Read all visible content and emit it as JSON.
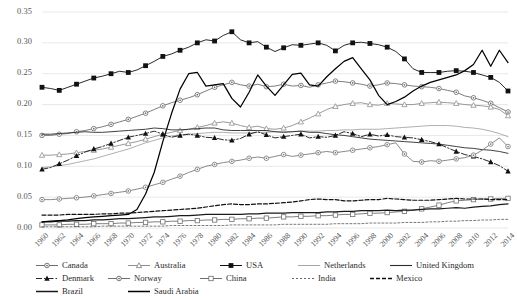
{
  "chart_data": {
    "type": "line",
    "title": "",
    "xlabel": "",
    "ylabel": "",
    "ylim": [
      0.0,
      0.35
    ],
    "ytick_labels": [
      "0.00",
      "0.05",
      "0.10",
      "0.15",
      "0.20",
      "0.25",
      "0.30",
      "0.35"
    ],
    "ytick_values": [
      0.0,
      0.05,
      0.1,
      0.15,
      0.2,
      0.25,
      0.3,
      0.35
    ],
    "grid": "horizontal",
    "legend_position": "bottom",
    "x": [
      1960,
      1961,
      1962,
      1963,
      1964,
      1965,
      1966,
      1967,
      1968,
      1969,
      1970,
      1971,
      1972,
      1973,
      1974,
      1975,
      1976,
      1977,
      1978,
      1979,
      1980,
      1981,
      1982,
      1983,
      1984,
      1985,
      1986,
      1987,
      1988,
      1989,
      1990,
      1991,
      1992,
      1993,
      1994,
      1995,
      1996,
      1997,
      1998,
      1999,
      2000,
      2001,
      2002,
      2003,
      2004,
      2005,
      2006,
      2007,
      2008,
      2009,
      2010,
      2011,
      2012,
      2013,
      2014
    ],
    "xtick_labels": [
      "1960",
      "1962",
      "1964",
      "1966",
      "1968",
      "1970",
      "1972",
      "1974",
      "1976",
      "1978",
      "1980",
      "1982",
      "1984",
      "1986",
      "1988",
      "1990",
      "1992",
      "1994",
      "1996",
      "1998",
      "2000",
      "2002",
      "2004",
      "2006",
      "2008",
      "2010",
      "2012",
      "2014"
    ],
    "series": [
      {
        "name": "Canada",
        "marker": "circle-dot",
        "color": "#6e6e6e",
        "line": "solid",
        "values": [
          0.15,
          0.15,
          0.152,
          0.153,
          0.156,
          0.158,
          0.161,
          0.164,
          0.168,
          0.172,
          0.176,
          0.181,
          0.186,
          0.192,
          0.198,
          0.203,
          0.207,
          0.211,
          0.216,
          0.222,
          0.228,
          0.232,
          0.236,
          0.232,
          0.23,
          0.233,
          0.229,
          0.23,
          0.233,
          0.23,
          0.231,
          0.228,
          0.232,
          0.235,
          0.238,
          0.237,
          0.235,
          0.233,
          0.23,
          0.232,
          0.235,
          0.234,
          0.232,
          0.23,
          0.229,
          0.228,
          0.226,
          0.223,
          0.22,
          0.214,
          0.211,
          0.207,
          0.202,
          0.195,
          0.188
        ]
      },
      {
        "name": "Australia",
        "marker": "triangle-open",
        "color": "#8f8f8f",
        "line": "solid",
        "values": [
          0.118,
          0.118,
          0.119,
          0.12,
          0.122,
          0.124,
          0.126,
          0.128,
          0.131,
          0.134,
          0.137,
          0.14,
          0.144,
          0.148,
          0.152,
          0.155,
          0.158,
          0.16,
          0.163,
          0.166,
          0.17,
          0.172,
          0.17,
          0.166,
          0.163,
          0.165,
          0.161,
          0.16,
          0.162,
          0.166,
          0.172,
          0.178,
          0.185,
          0.192,
          0.197,
          0.2,
          0.202,
          0.203,
          0.2,
          0.199,
          0.202,
          0.201,
          0.2,
          0.2,
          0.202,
          0.203,
          0.204,
          0.203,
          0.202,
          0.2,
          0.199,
          0.198,
          0.196,
          0.192,
          0.182
        ]
      },
      {
        "name": "USA",
        "marker": "square-filled",
        "color": "#111111",
        "line": "solid",
        "values": [
          0.228,
          0.226,
          0.223,
          0.228,
          0.233,
          0.238,
          0.243,
          0.246,
          0.25,
          0.254,
          0.252,
          0.256,
          0.263,
          0.27,
          0.278,
          0.282,
          0.288,
          0.293,
          0.3,
          0.305,
          0.303,
          0.312,
          0.318,
          0.305,
          0.3,
          0.302,
          0.293,
          0.286,
          0.292,
          0.297,
          0.296,
          0.298,
          0.3,
          0.296,
          0.287,
          0.296,
          0.3,
          0.301,
          0.299,
          0.297,
          0.293,
          0.286,
          0.274,
          0.258,
          0.252,
          0.252,
          0.252,
          0.254,
          0.255,
          0.254,
          0.252,
          0.248,
          0.244,
          0.236,
          0.222
        ]
      },
      {
        "name": "Netherlands",
        "marker": "none",
        "color": "#9a9a9a",
        "line": "solid-thin",
        "values": [
          0.098,
          0.099,
          0.101,
          0.103,
          0.106,
          0.109,
          0.112,
          0.116,
          0.12,
          0.124,
          0.128,
          0.133,
          0.138,
          0.142,
          0.146,
          0.149,
          0.151,
          0.152,
          0.153,
          0.154,
          0.155,
          0.155,
          0.154,
          0.154,
          0.154,
          0.155,
          0.155,
          0.156,
          0.156,
          0.156,
          0.157,
          0.157,
          0.157,
          0.158,
          0.158,
          0.159,
          0.159,
          0.16,
          0.16,
          0.16,
          0.161,
          0.162,
          0.163,
          0.164,
          0.165,
          0.166,
          0.166,
          0.166,
          0.165,
          0.163,
          0.162,
          0.16,
          0.157,
          0.153,
          0.148
        ]
      },
      {
        "name": "United Kingdom",
        "marker": "none",
        "color": "#2b2b2b",
        "line": "solid",
        "values": [
          0.152,
          0.152,
          0.153,
          0.154,
          0.155,
          0.156,
          0.155,
          0.155,
          0.156,
          0.157,
          0.158,
          0.159,
          0.16,
          0.162,
          0.161,
          0.159,
          0.159,
          0.16,
          0.161,
          0.162,
          0.162,
          0.159,
          0.158,
          0.158,
          0.158,
          0.158,
          0.158,
          0.156,
          0.155,
          0.156,
          0.157,
          0.155,
          0.155,
          0.153,
          0.151,
          0.15,
          0.148,
          0.146,
          0.144,
          0.143,
          0.142,
          0.141,
          0.14,
          0.139,
          0.138,
          0.137,
          0.136,
          0.134,
          0.132,
          0.13,
          0.129,
          0.127,
          0.126,
          0.124,
          0.121
        ]
      },
      {
        "name": "Denmark",
        "marker": "triangle-filled",
        "color": "#111111",
        "line": "dashdot",
        "values": [
          0.095,
          0.098,
          0.104,
          0.11,
          0.117,
          0.123,
          0.128,
          0.132,
          0.137,
          0.142,
          0.147,
          0.15,
          0.153,
          0.157,
          0.152,
          0.147,
          0.15,
          0.152,
          0.15,
          0.147,
          0.146,
          0.143,
          0.142,
          0.145,
          0.152,
          0.156,
          0.151,
          0.146,
          0.148,
          0.15,
          0.152,
          0.146,
          0.148,
          0.147,
          0.15,
          0.156,
          0.153,
          0.148,
          0.152,
          0.149,
          0.151,
          0.148,
          0.147,
          0.146,
          0.143,
          0.14,
          0.136,
          0.13,
          0.124,
          0.119,
          0.116,
          0.112,
          0.107,
          0.101,
          0.092
        ]
      },
      {
        "name": "Norway",
        "marker": "circle-dot",
        "color": "#7c7c7c",
        "line": "solid",
        "values": [
          0.046,
          0.046,
          0.047,
          0.048,
          0.049,
          0.05,
          0.052,
          0.054,
          0.056,
          0.058,
          0.06,
          0.063,
          0.066,
          0.07,
          0.074,
          0.079,
          0.084,
          0.09,
          0.095,
          0.1,
          0.103,
          0.106,
          0.108,
          0.11,
          0.113,
          0.115,
          0.113,
          0.116,
          0.119,
          0.116,
          0.118,
          0.12,
          0.122,
          0.124,
          0.122,
          0.124,
          0.126,
          0.128,
          0.13,
          0.132,
          0.135,
          0.138,
          0.12,
          0.108,
          0.107,
          0.109,
          0.108,
          0.11,
          0.112,
          0.114,
          0.118,
          0.126,
          0.136,
          0.146,
          0.132
        ]
      },
      {
        "name": "China",
        "marker": "square-open",
        "color": "#6f6f6f",
        "line": "solid",
        "values": [
          0.005,
          0.005,
          0.005,
          0.006,
          0.006,
          0.006,
          0.007,
          0.007,
          0.007,
          0.008,
          0.008,
          0.009,
          0.009,
          0.01,
          0.01,
          0.011,
          0.011,
          0.012,
          0.012,
          0.013,
          0.013,
          0.014,
          0.014,
          0.015,
          0.015,
          0.016,
          0.016,
          0.017,
          0.018,
          0.018,
          0.019,
          0.019,
          0.02,
          0.02,
          0.021,
          0.022,
          0.022,
          0.023,
          0.024,
          0.024,
          0.025,
          0.026,
          0.027,
          0.029,
          0.031,
          0.034,
          0.037,
          0.041,
          0.044,
          0.045,
          0.046,
          0.047,
          0.047,
          0.048,
          0.048
        ]
      },
      {
        "name": "India",
        "marker": "none",
        "color": "#555555",
        "line": "dashed-fine",
        "values": [
          0.002,
          0.002,
          0.002,
          0.002,
          0.002,
          0.002,
          0.002,
          0.003,
          0.003,
          0.003,
          0.003,
          0.003,
          0.003,
          0.003,
          0.003,
          0.004,
          0.004,
          0.004,
          0.004,
          0.004,
          0.004,
          0.004,
          0.005,
          0.005,
          0.005,
          0.005,
          0.005,
          0.005,
          0.006,
          0.006,
          0.006,
          0.006,
          0.006,
          0.006,
          0.007,
          0.007,
          0.007,
          0.007,
          0.008,
          0.008,
          0.008,
          0.008,
          0.009,
          0.009,
          0.009,
          0.01,
          0.01,
          0.011,
          0.011,
          0.012,
          0.012,
          0.013,
          0.013,
          0.014,
          0.014
        ]
      },
      {
        "name": "Mexico",
        "marker": "none",
        "color": "#111111",
        "line": "dashed",
        "values": [
          0.021,
          0.021,
          0.021,
          0.022,
          0.022,
          0.022,
          0.022,
          0.023,
          0.023,
          0.024,
          0.024,
          0.025,
          0.026,
          0.027,
          0.028,
          0.029,
          0.03,
          0.031,
          0.032,
          0.034,
          0.036,
          0.038,
          0.039,
          0.038,
          0.038,
          0.039,
          0.039,
          0.04,
          0.041,
          0.042,
          0.044,
          0.046,
          0.047,
          0.046,
          0.046,
          0.044,
          0.044,
          0.045,
          0.046,
          0.046,
          0.048,
          0.047,
          0.046,
          0.045,
          0.045,
          0.045,
          0.046,
          0.047,
          0.048,
          0.047,
          0.047,
          0.047,
          0.046,
          0.046,
          0.046
        ]
      },
      {
        "name": "Brazil",
        "marker": "none",
        "color": "#1a1a1a",
        "line": "solid-heavy",
        "values": [
          0.01,
          0.01,
          0.011,
          0.011,
          0.012,
          0.012,
          0.013,
          0.013,
          0.014,
          0.015,
          0.015,
          0.016,
          0.017,
          0.018,
          0.018,
          0.019,
          0.02,
          0.02,
          0.021,
          0.022,
          0.022,
          0.022,
          0.022,
          0.022,
          0.023,
          0.023,
          0.024,
          0.024,
          0.024,
          0.025,
          0.025,
          0.025,
          0.025,
          0.026,
          0.026,
          0.027,
          0.027,
          0.028,
          0.028,
          0.028,
          0.029,
          0.028,
          0.029,
          0.029,
          0.03,
          0.031,
          0.031,
          0.032,
          0.033,
          0.032,
          0.034,
          0.035,
          0.036,
          0.038,
          0.039
        ]
      },
      {
        "name": "Saudi Arabia",
        "marker": "none",
        "color": "#000000",
        "line": "solid-heavy",
        "values": [
          0.01,
          0.011,
          0.012,
          0.013,
          0.015,
          0.017,
          0.018,
          0.019,
          0.02,
          0.021,
          0.022,
          0.03,
          0.055,
          0.09,
          0.14,
          0.185,
          0.225,
          0.25,
          0.252,
          0.23,
          0.232,
          0.234,
          0.21,
          0.196,
          0.22,
          0.248,
          0.23,
          0.215,
          0.232,
          0.249,
          0.251,
          0.232,
          0.23,
          0.245,
          0.258,
          0.27,
          0.276,
          0.258,
          0.24,
          0.215,
          0.2,
          0.205,
          0.212,
          0.222,
          0.23,
          0.236,
          0.24,
          0.244,
          0.248,
          0.255,
          0.265,
          0.288,
          0.262,
          0.288,
          0.268
        ]
      }
    ]
  },
  "legend": {
    "items": [
      {
        "label": "Canada",
        "key": "circle-dot"
      },
      {
        "label": "Australia",
        "key": "triangle-open"
      },
      {
        "label": "USA",
        "key": "square-filled"
      },
      {
        "label": "Netherlands",
        "key": "line-thin"
      },
      {
        "label": "United Kingdom",
        "key": "line-solid"
      },
      {
        "label": "Denmark",
        "key": "triangle-filled"
      },
      {
        "label": "Norway",
        "key": "circle-dot"
      },
      {
        "label": "China",
        "key": "square-open"
      },
      {
        "label": "India",
        "key": "line-dashfine"
      },
      {
        "label": "Mexico",
        "key": "line-dashed"
      },
      {
        "label": "Brazil",
        "key": "line-heavy"
      },
      {
        "label": "Saudi Arabia",
        "key": "line-heavy2"
      }
    ]
  }
}
